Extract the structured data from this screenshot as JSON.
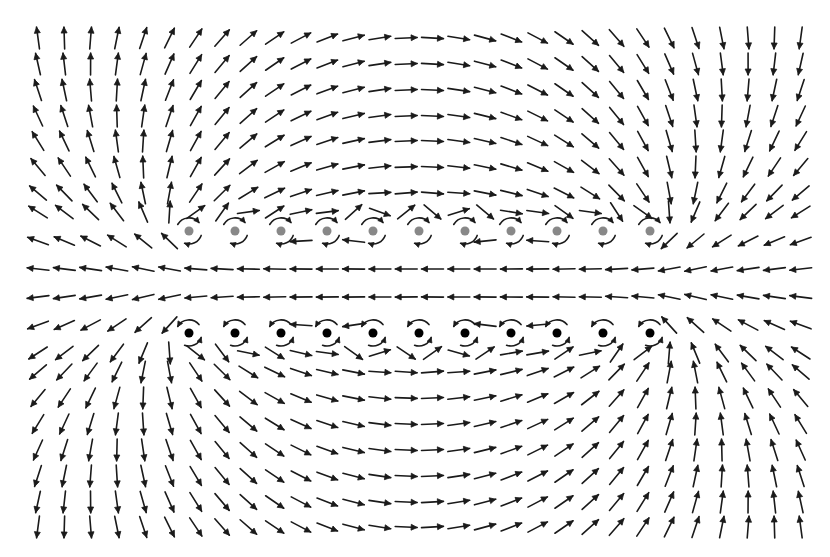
{
  "diagram": {
    "type": "vector-field",
    "canvas": {
      "width": 830,
      "height": 557,
      "background": "#ffffff"
    },
    "arrow_color": "#1a1a1a",
    "grid": {
      "columns_x_start": 38,
      "columns_x_step": 26.3,
      "columns_count": 30,
      "rows_y": [
        38,
        64,
        90,
        116,
        141,
        167,
        193,
        212,
        241,
        269,
        297,
        325,
        353,
        372,
        398,
        424,
        450,
        476,
        502,
        527
      ],
      "arrow_length": 22
    },
    "vortex_rows": [
      {
        "name": "upper-row",
        "color": "#888888",
        "y": 231,
        "circulation": "clockwise",
        "x_positions": [
          189,
          235,
          281,
          327,
          373,
          419,
          465,
          511,
          557,
          603,
          650
        ]
      },
      {
        "name": "lower-row",
        "color": "#000000",
        "y": 333,
        "circulation": "counterclockwise",
        "x_positions": [
          189,
          235,
          281,
          327,
          373,
          419,
          465,
          511,
          557,
          603,
          650
        ]
      }
    ],
    "dot_radius": 4.5,
    "local_arc_radius": 13
  }
}
